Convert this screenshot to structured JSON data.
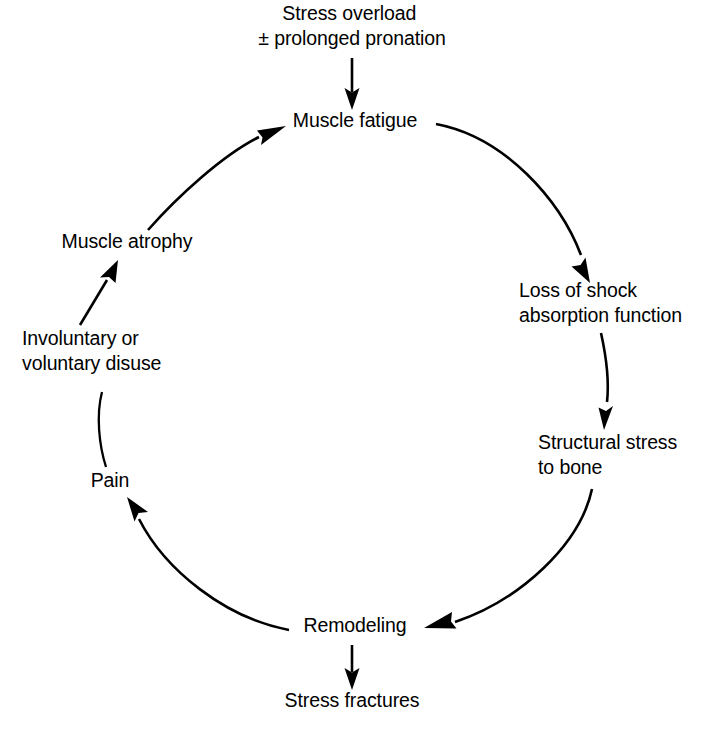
{
  "diagram": {
    "type": "cycle-flow-diagram",
    "background_color": "#ffffff",
    "stroke_color": "#000000",
    "nodes": [
      {
        "id": "stress-overload",
        "lines": [
          "Stress overload",
          "± prolonged pronation"
        ],
        "x": 352,
        "y": 20,
        "anchor": "middle"
      },
      {
        "id": "muscle-fatigue",
        "lines": [
          "Muscle fatigue"
        ],
        "x": 355,
        "y": 127,
        "anchor": "middle"
      },
      {
        "id": "loss-of-shock-absorption",
        "lines": [
          "Loss of shock",
          "absorption function"
        ],
        "x": 519,
        "y": 297,
        "anchor": "start"
      },
      {
        "id": "structural-stress-to-bone",
        "lines": [
          "Structural stress",
          "to bone"
        ],
        "x": 538,
        "y": 449,
        "anchor": "start"
      },
      {
        "id": "remodeling",
        "lines": [
          "Remodeling"
        ],
        "x": 355,
        "y": 632,
        "anchor": "middle"
      },
      {
        "id": "stress-fractures",
        "lines": [
          "Stress fractures"
        ],
        "x": 352,
        "y": 707,
        "anchor": "middle"
      },
      {
        "id": "pain",
        "lines": [
          "Pain"
        ],
        "x": 110,
        "y": 487,
        "anchor": "middle"
      },
      {
        "id": "involuntary-or-voluntary-disuse",
        "lines": [
          "Involuntary or",
          "voluntary disuse"
        ],
        "x": 22,
        "y": 345,
        "anchor": "start"
      },
      {
        "id": "muscle-atrophy",
        "lines": [
          "Muscle atrophy"
        ],
        "x": 127,
        "y": 248,
        "anchor": "middle"
      }
    ],
    "edges": [
      {
        "id": "stress-overload-to-muscle-fatigue",
        "from": "stress-overload",
        "to": "muscle-fatigue",
        "style": "straight"
      },
      {
        "id": "muscle-fatigue-to-loss-of-shock-absorption",
        "from": "muscle-fatigue",
        "to": "loss-of-shock-absorption",
        "style": "curved"
      },
      {
        "id": "loss-of-shock-absorption-to-structural-stress",
        "from": "loss-of-shock-absorption",
        "to": "structural-stress-to-bone",
        "style": "curved"
      },
      {
        "id": "structural-stress-to-remodeling",
        "from": "structural-stress-to-bone",
        "to": "remodeling",
        "style": "curved"
      },
      {
        "id": "remodeling-to-stress-fractures",
        "from": "remodeling",
        "to": "stress-fractures",
        "style": "straight"
      },
      {
        "id": "remodeling-to-pain",
        "from": "remodeling",
        "to": "pain",
        "style": "curved"
      },
      {
        "id": "pain-to-involuntary-disuse",
        "from": "pain",
        "to": "involuntary-or-voluntary-disuse",
        "style": "curved-no-head"
      },
      {
        "id": "involuntary-disuse-to-muscle-atrophy",
        "from": "involuntary-or-voluntary-disuse",
        "to": "muscle-atrophy",
        "style": "straight"
      },
      {
        "id": "muscle-atrophy-to-muscle-fatigue",
        "from": "muscle-atrophy",
        "to": "muscle-fatigue",
        "style": "curved"
      }
    ]
  }
}
